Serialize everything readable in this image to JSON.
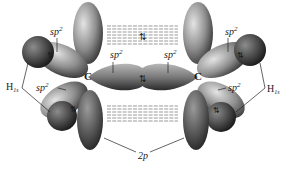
{
  "diagram": {
    "atoms": {
      "left_carbon": "C",
      "right_carbon": "C"
    },
    "labels": {
      "sp2_upper_left": {
        "base": "sp",
        "sup": "2"
      },
      "sp2_center_left": {
        "base": "sp",
        "sup": "2"
      },
      "sp2_center_right": {
        "base": "sp",
        "sup": "2"
      },
      "sp2_upper_right": {
        "base": "sp",
        "sup": "2"
      },
      "sp2_lower_left": {
        "base": "sp",
        "sup": "2"
      },
      "sp2_lower_right": {
        "base": "sp",
        "sup": "2"
      },
      "h1s_left": {
        "base": "H",
        "sub": "1s"
      },
      "h1s_right": {
        "base": "H",
        "sub": "1s"
      },
      "p_orbital": "2p"
    },
    "electron_pair_symbol": "⇅",
    "colors": {
      "lobe_light": "#cfcfcf",
      "lobe_mid": "#8a8a8a",
      "lobe_dark": "#3a3a3a",
      "hydrogen": "#4a4a4a",
      "leader_line": "#222222",
      "overlap_dash": "#555555"
    }
  }
}
